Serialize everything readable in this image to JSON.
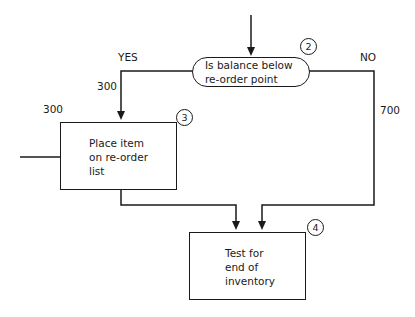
{
  "diagram": {
    "type": "flowchart",
    "nodes": {
      "decision": {
        "number": "2",
        "line1": "Is balance below",
        "line2": "re-order point"
      },
      "reorder": {
        "number": "3",
        "line1": "Place item",
        "line2": "on re-order",
        "line3": "list"
      },
      "test": {
        "number": "4",
        "line1": "Test for",
        "line2": "end of",
        "line3": "inventory"
      }
    },
    "edges": {
      "yes_label": "YES",
      "no_label": "NO",
      "yes_count": "300",
      "no_count": "700",
      "reorder_in_count": "300"
    }
  }
}
